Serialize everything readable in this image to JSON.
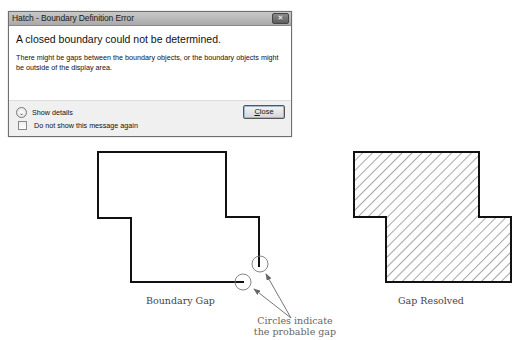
{
  "dialog": {
    "title": "Hatch - Boundary Definition Error",
    "close_glyph": "✕",
    "main_instruction": "A closed boundary could not be determined.",
    "content": "There might be gaps between the boundary objects, or the boundary objects might be outside of the display area.",
    "show_details_label": "Show details",
    "checkbox_label": "Do not show this message again",
    "checkbox_checked": false,
    "close_button_label": "Close",
    "close_button_accesskey": "C"
  },
  "figures": {
    "left": {
      "caption": "Boundary Gap",
      "annotation_line1": "Circles indicate",
      "annotation_line2": "the probable gap"
    },
    "right": {
      "caption": "Gap Resolved"
    }
  }
}
